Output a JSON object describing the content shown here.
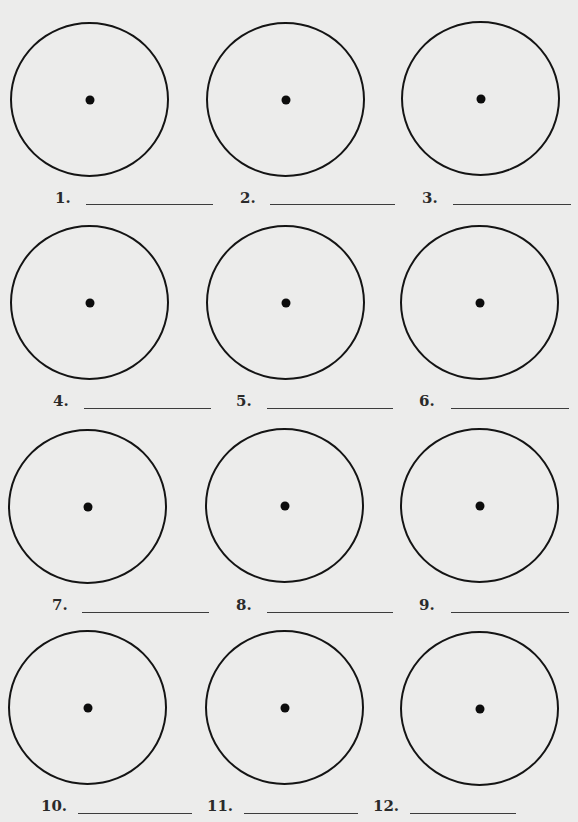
{
  "worksheet": {
    "items": [
      {
        "number": "1.",
        "answer": ""
      },
      {
        "number": "2.",
        "answer": ""
      },
      {
        "number": "3.",
        "answer": ""
      },
      {
        "number": "4.",
        "answer": ""
      },
      {
        "number": "5.",
        "answer": ""
      },
      {
        "number": "6.",
        "answer": ""
      },
      {
        "number": "7.",
        "answer": ""
      },
      {
        "number": "8.",
        "answer": ""
      },
      {
        "number": "9.",
        "answer": ""
      },
      {
        "number": "10.",
        "answer": ""
      },
      {
        "number": "11.",
        "answer": ""
      },
      {
        "number": "12.",
        "answer": ""
      }
    ]
  },
  "colors": {
    "background": "#ececeb",
    "ink": "#141414"
  }
}
